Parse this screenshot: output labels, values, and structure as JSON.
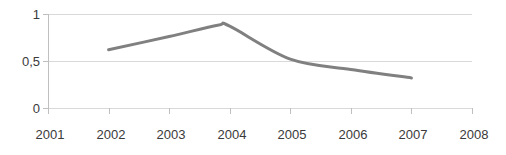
{
  "chart_data": {
    "type": "line",
    "title": "",
    "subtitle": "",
    "xlabel": "",
    "ylabel": "",
    "x": [
      2002,
      2003,
      2004,
      2005,
      2006,
      2007
    ],
    "series": [
      {
        "name": "series-1",
        "values": [
          0.62,
          0.76,
          0.87,
          0.52,
          0.41,
          0.32
        ],
        "color": "#808080",
        "line_width": 3,
        "smooth": true,
        "markers": false
      }
    ],
    "annotations": [
      {
        "text": "peak",
        "x": 2003.8,
        "y": 0.88
      }
    ],
    "xlim": [
      2001,
      2008
    ],
    "ylim": [
      0,
      1
    ],
    "x_tick_values": [
      2001,
      2002,
      2003,
      2004,
      2005,
      2006,
      2007,
      2008
    ],
    "x_tick_labels": [
      "2001",
      "2002",
      "2003",
      "2004",
      "2005",
      "2006",
      "2007",
      "2008"
    ],
    "y_tick_values": [
      0,
      0.5,
      1
    ],
    "y_tick_labels": [
      "0",
      "0,5",
      "1"
    ],
    "grid": {
      "horizontal": true,
      "vertical": false,
      "color": "#d9d9d9"
    },
    "legend": {
      "visible": false,
      "position": "none",
      "entries": []
    },
    "axis": {
      "y_axis_line_color": "#bfbfbf",
      "x_axis_line_color": "#bfbfbf",
      "tick_mark_color": "#bfbfbf"
    },
    "background_color": "#ffffff",
    "text_color": "#3a3a3a"
  }
}
